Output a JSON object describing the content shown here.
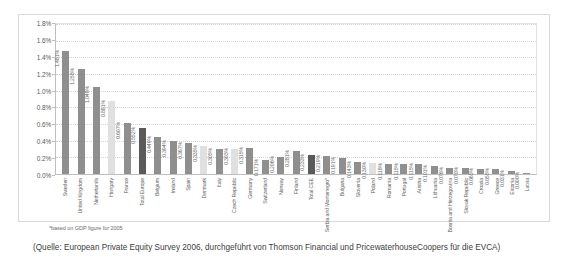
{
  "chart_data": {
    "type": "bar",
    "title": "",
    "subtitle": "",
    "xlabel": "",
    "ylabel": "",
    "ylim": [
      0,
      1.8
    ],
    "grid": true,
    "legend": "none",
    "ytick_labels": [
      "1.8%",
      "1.6%",
      "1.4%",
      "1.2%",
      "1.0%",
      "0.8%",
      "0.6%",
      "0.4%",
      "0.2%",
      "0.0%"
    ],
    "ytick_values": [
      1.8,
      1.6,
      1.4,
      1.2,
      1.0,
      0.8,
      0.6,
      0.4,
      0.2,
      0.0
    ],
    "categories": [
      "Sweden",
      "United Kingdom",
      "Netherlands",
      "Hungary",
      "France",
      "Total Europe",
      "Belgium",
      "Ireland",
      "Spain",
      "Denmark",
      "Italy",
      "Czech Republic",
      "Germany",
      "Switzerland",
      "Norway",
      "Finland",
      "Total CEE",
      "Serbia and Montenegro*",
      "Bulgaria",
      "Slovenia",
      "Poland",
      "Romania",
      "Portugal",
      "Austria",
      "Lithuania",
      "Bosnia and Herzegovina",
      "Slovak Republic",
      "Croatia",
      "Greece",
      "Estonia",
      "Latvia"
    ],
    "values": [
      1.481,
      1.258,
      1.048,
      0.881,
      0.607,
      0.552,
      0.449,
      0.394,
      0.367,
      0.335,
      0.305,
      0.303,
      0.315,
      0.171,
      0.206,
      0.281,
      0.233,
      0.219,
      0.191,
      0.143,
      0.13,
      0.118,
      0.115,
      0.115,
      0.101,
      0.076,
      0.07,
      0.065,
      0.055,
      0.031,
      0.0
    ],
    "value_labels": [
      "1.481%",
      "1.258%",
      "1.048%",
      "0.881%",
      "0.607%",
      "0.552%",
      "0.449%",
      "0.394%",
      "0.367%",
      "0.335%",
      "0.305%",
      "0.303%",
      "0.315%",
      "0.171%",
      "0.206%",
      "0.281%",
      "0.233%",
      "0.219%",
      "0.191%",
      "0.143%",
      "0.130%",
      "0.118%",
      "0.115%",
      "0.115%",
      "0.101%",
      "0.076%",
      "0.070%",
      "0.065%",
      "0.055%",
      "0.031%",
      "0.000%"
    ],
    "bar_styles": [
      "mid",
      "mid",
      "mid",
      "light",
      "mid",
      "dark",
      "mid",
      "mid",
      "mid",
      "light",
      "mid",
      "light",
      "mid",
      "mid",
      "mid",
      "mid",
      "dark",
      "mid",
      "mid",
      "mid",
      "light",
      "mid",
      "mid",
      "mid",
      "mid",
      "mid",
      "mid",
      "mid",
      "mid",
      "mid",
      "mid"
    ],
    "colors": {
      "bar_default": "#9a9a9a",
      "bar_light": "#e0e0e0",
      "bar_dark": "#5a5a5a",
      "grid": "#d2d2d2",
      "axis": "#bfbfbf",
      "text": "#5f5f5f"
    }
  },
  "footnote": "*based on GDP figure for 2005",
  "source": "(Quelle: European Private Equity Survey 2006, durchgeführt von Thomson Financial und PricewaterhouseCoopers für die EVCA)"
}
